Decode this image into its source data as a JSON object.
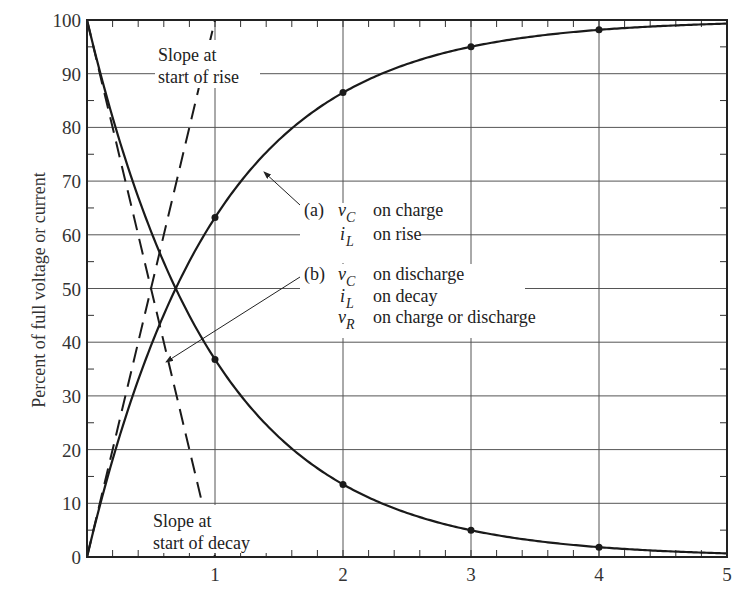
{
  "chart_data": {
    "type": "line",
    "title": "",
    "xlabel": "",
    "ylabel": "Percent of full voltage or current",
    "xlim": [
      0,
      5
    ],
    "ylim": [
      0,
      100
    ],
    "grid": true,
    "x_ticks": [
      "1",
      "2",
      "3",
      "4",
      "5"
    ],
    "y_ticks": [
      "0",
      "10",
      "20",
      "30",
      "40",
      "50",
      "60",
      "70",
      "80",
      "90",
      "100"
    ],
    "series": [
      {
        "name": "(a) rise: 100(1 - e^-t)",
        "style": "solid",
        "x": [
          0,
          1,
          2,
          3,
          4,
          5
        ],
        "values": [
          0,
          63.2,
          86.5,
          95.0,
          98.2,
          99.3
        ],
        "markers_at": [
          1,
          2,
          3,
          4
        ]
      },
      {
        "name": "(b) decay: 100 e^-t",
        "style": "solid",
        "x": [
          0,
          1,
          2,
          3,
          4,
          5
        ],
        "values": [
          100,
          36.8,
          13.5,
          5.0,
          1.8,
          0.7
        ],
        "markers_at": [
          1,
          2,
          3,
          4
        ]
      },
      {
        "name": "Slope at start of rise",
        "style": "dashed",
        "x": [
          0,
          1
        ],
        "values": [
          0,
          100
        ]
      },
      {
        "name": "Slope at start of decay",
        "style": "dashed",
        "x": [
          0,
          1
        ],
        "values": [
          100,
          0
        ]
      }
    ],
    "annotations": [
      {
        "id": "slope_rise",
        "lines": [
          "Slope at",
          "start of rise"
        ]
      },
      {
        "id": "slope_decay",
        "lines": [
          "Slope at",
          "start of decay"
        ]
      },
      {
        "id": "a",
        "label": "(a)",
        "items": [
          {
            "sym": "v",
            "sub": "C",
            "text": "on charge"
          },
          {
            "sym": "i",
            "sub": "L",
            "text": "on rise"
          }
        ]
      },
      {
        "id": "b",
        "label": "(b)",
        "items": [
          {
            "sym": "v",
            "sub": "C",
            "text": "on discharge"
          },
          {
            "sym": "i",
            "sub": "L",
            "text": "on decay"
          },
          {
            "sym": "v",
            "sub": "R",
            "text": "on charge or discharge"
          }
        ]
      }
    ]
  },
  "labels": {
    "ylabel": "Percent of full voltage or current",
    "slope_rise_1": "Slope at",
    "slope_rise_2": "start of rise",
    "slope_decay_1": "Slope at",
    "slope_decay_2": "start of decay",
    "a_tag": "(a)",
    "a_line1_sym": "v",
    "a_line1_sub": "C",
    "a_line1_text": "on charge",
    "a_line2_sym": "i",
    "a_line2_sub": "L",
    "a_line2_text": "on rise",
    "b_tag": "(b)",
    "b_line1_sym": "v",
    "b_line1_sub": "C",
    "b_line1_text": "on discharge",
    "b_line2_sym": "i",
    "b_line2_sub": "L",
    "b_line2_text": "on decay",
    "b_line3_sym": "v",
    "b_line3_sub": "R",
    "b_line3_text": "on charge or discharge"
  },
  "colors": {
    "line": "#1a1a1a",
    "grid": "#555555",
    "background": "#ffffff"
  }
}
